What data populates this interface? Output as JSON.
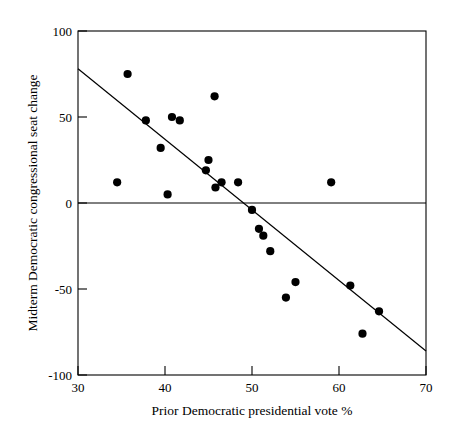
{
  "chart_data": {
    "type": "scatter",
    "title": "",
    "xlabel": "Prior Democratic presidential vote %",
    "ylabel": "Midterm Democratic congressional seat change",
    "xlim": [
      30,
      70
    ],
    "ylim": [
      -100,
      100
    ],
    "xticks": [
      30,
      40,
      50,
      60,
      70
    ],
    "yticks": [
      -100,
      -50,
      0,
      50,
      100
    ],
    "xtick_labels": [
      "30",
      "40",
      "50",
      "60",
      "70"
    ],
    "ytick_labels": [
      "-100",
      "-50",
      "0",
      "50",
      "100"
    ],
    "grid": false,
    "legend": null,
    "reference_lines": [
      {
        "name": "zero-line",
        "orientation": "horizontal",
        "y": 0
      }
    ],
    "fit_line": {
      "name": "regression-line",
      "x": [
        30,
        70
      ],
      "y": [
        78,
        -86
      ],
      "slope": -4.1,
      "intercept": 201
    },
    "points": [
      {
        "x": 34.5,
        "y": 12
      },
      {
        "x": 35.7,
        "y": 75
      },
      {
        "x": 37.8,
        "y": 48
      },
      {
        "x": 39.5,
        "y": 32
      },
      {
        "x": 40.3,
        "y": 5
      },
      {
        "x": 40.8,
        "y": 50
      },
      {
        "x": 41.7,
        "y": 48
      },
      {
        "x": 44.7,
        "y": 19
      },
      {
        "x": 45.0,
        "y": 25
      },
      {
        "x": 45.7,
        "y": 62
      },
      {
        "x": 45.8,
        "y": 9
      },
      {
        "x": 46.5,
        "y": 12
      },
      {
        "x": 48.4,
        "y": 12
      },
      {
        "x": 50.0,
        "y": -4
      },
      {
        "x": 50.8,
        "y": -15
      },
      {
        "x": 51.3,
        "y": -19
      },
      {
        "x": 52.1,
        "y": -28
      },
      {
        "x": 53.9,
        "y": -55
      },
      {
        "x": 55.0,
        "y": -46
      },
      {
        "x": 59.1,
        "y": 12
      },
      {
        "x": 61.3,
        "y": -48
      },
      {
        "x": 62.7,
        "y": -76
      },
      {
        "x": 64.6,
        "y": -63
      }
    ],
    "colors": {
      "point": "#000000",
      "line": "#000000",
      "axis": "#000000",
      "background": "#ffffff"
    }
  }
}
